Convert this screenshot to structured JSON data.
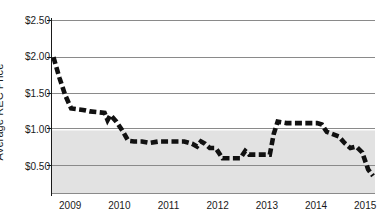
{
  "chart_data": {
    "type": "line",
    "title": "",
    "xlabel": "",
    "ylabel": "Average REC Price",
    "xlim": [
      2008.62,
      2015.2
    ],
    "ylim": [
      0.14,
      2.5
    ],
    "ytick_values": [
      2.5,
      2.0,
      1.5,
      1.0,
      0.5
    ],
    "ytick_labels": [
      "$2.50",
      "$2.00",
      "$1.50",
      "$1.00",
      "$0.50"
    ],
    "xtick_values": [
      2009,
      2010,
      2011,
      2012,
      2013,
      2014,
      2015
    ],
    "xtick_labels": [
      "2009",
      "2010",
      "2011",
      "2012",
      "2013",
      "2014",
      "2015"
    ],
    "grid": "horizontal",
    "legend": "none",
    "line_style": "dashed",
    "line_color": "#111111",
    "line_width": 4.6,
    "shaded_band": {
      "from": 1.0,
      "to": 0.14,
      "color": "#e2e2e2",
      "label": ""
    },
    "series": [
      {
        "name": "Average REC Price",
        "x": [
          2008.66,
          2008.78,
          2008.9,
          2009.02,
          2009.14,
          2009.26,
          2009.4,
          2009.56,
          2009.7,
          2009.76,
          2009.82,
          2009.94,
          2010.06,
          2010.18,
          2010.3,
          2010.46,
          2010.62,
          2010.8,
          2011.0,
          2011.16,
          2011.32,
          2011.48,
          2011.58,
          2011.66,
          2011.74,
          2011.84,
          2011.96,
          2012.1,
          2012.3,
          2012.46,
          2012.56,
          2012.64,
          2012.76,
          2012.92,
          2013.06,
          2013.14,
          2013.22,
          2013.4,
          2013.6,
          2013.84,
          2014.02,
          2014.12,
          2014.22,
          2014.34,
          2014.46,
          2014.58,
          2014.7,
          2014.82,
          2014.94,
          2015.06,
          2015.16
        ],
        "y": [
          2.0,
          1.72,
          1.48,
          1.3,
          1.29,
          1.28,
          1.26,
          1.25,
          1.24,
          1.14,
          1.21,
          1.12,
          1.0,
          0.86,
          0.85,
          0.85,
          0.83,
          0.85,
          0.85,
          0.85,
          0.85,
          0.82,
          0.78,
          0.85,
          0.82,
          0.76,
          0.76,
          0.62,
          0.62,
          0.62,
          0.72,
          0.67,
          0.67,
          0.67,
          0.67,
          0.95,
          1.12,
          1.1,
          1.1,
          1.1,
          1.1,
          1.08,
          0.98,
          0.95,
          0.92,
          0.83,
          0.76,
          0.78,
          0.7,
          0.47,
          0.38
        ]
      }
    ]
  },
  "axis": {
    "y_title": "Average REC Price"
  }
}
